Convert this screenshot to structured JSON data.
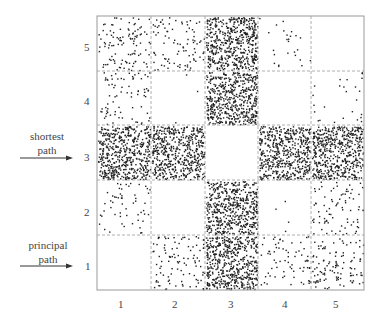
{
  "chart_data": {
    "type": "scatter",
    "title": "",
    "xlabel": "",
    "ylabel": "",
    "grid": "5x5 dashed cells",
    "x_ticks": [
      "1",
      "2",
      "3",
      "4",
      "5"
    ],
    "y_ticks": [
      "1",
      "2",
      "3",
      "4",
      "5"
    ],
    "xlim": [
      0.5,
      5.5
    ],
    "ylim": [
      0.5,
      5.5
    ],
    "annotations": [
      {
        "text": "shortest path",
        "points_to_row": 3
      },
      {
        "text": "principal path",
        "points_to_row": 1
      }
    ],
    "cell_density": {
      "description": "approximate relative point counts per cell, rows listed top (5) to bottom (1), columns 1..5",
      "rows": [
        {
          "row": 5,
          "counts": [
            110,
            90,
            520,
            25,
            0
          ]
        },
        {
          "row": 4,
          "counts": [
            75,
            3,
            520,
            0,
            25
          ]
        },
        {
          "row": 3,
          "counts": [
            520,
            520,
            0,
            520,
            520
          ]
        },
        {
          "row": 2,
          "counts": [
            55,
            0,
            520,
            4,
            80
          ]
        },
        {
          "row": 1,
          "counts": [
            0,
            100,
            520,
            70,
            110
          ]
        }
      ]
    }
  },
  "labels": {
    "x": [
      "1",
      "2",
      "3",
      "4",
      "5"
    ],
    "y": [
      "5",
      "4",
      "3",
      "2",
      "1"
    ],
    "shortest_line1": "shortest",
    "shortest_line2": "path",
    "principal_line1": "principal",
    "principal_line2": "path"
  }
}
